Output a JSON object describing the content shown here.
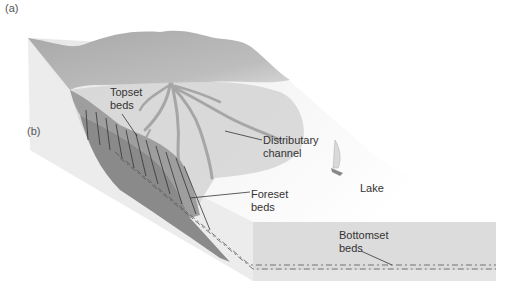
{
  "figure": {
    "panel_labels": {
      "a": "(a)",
      "b": "(b)"
    },
    "labels": {
      "topset": "Topset\nbeds",
      "distributary": "Distributary\nchannel",
      "foreset": "Foreset\nbeds",
      "lake": "Lake",
      "bottomset": "Bottomset\nbeds"
    },
    "colors": {
      "mountain": "#b3b3b3",
      "delta_plain": "#d9d9d9",
      "lake_surface": "#f2f2f2",
      "left_face": "#ebebeb",
      "foreset": "#8c8c8c",
      "front_face": "#dcdcdc",
      "leader_line": "#333333"
    }
  }
}
